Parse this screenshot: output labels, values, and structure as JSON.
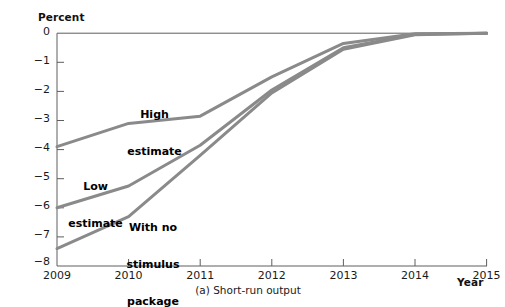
{
  "chart_data": {
    "type": "line",
    "title": "",
    "caption": "(a) Short-run output",
    "xlabel": "Year",
    "ylabel": "Percent",
    "x": [
      2009,
      2010,
      2011,
      2012,
      2013,
      2014,
      2015
    ],
    "xtick_labels": [
      "2009",
      "2010",
      "2011",
      "2012",
      "2013",
      "2014",
      "2015"
    ],
    "ytick_labels": [
      "0",
      "−1",
      "−2",
      "−3",
      "−4",
      "−5",
      "−6",
      "−7",
      "−8"
    ],
    "ytick_values": [
      0,
      -1,
      -2,
      -3,
      -4,
      -5,
      -6,
      -7,
      -8
    ],
    "xlim": [
      2009,
      2015
    ],
    "ylim": [
      -8,
      0
    ],
    "grid": false,
    "legend_position": "inline-annotations",
    "line_color": "#8a8a8a",
    "series": [
      {
        "name": "High estimate",
        "label": "High\nestimate",
        "values": [
          -3.9,
          -3.1,
          -2.85,
          -1.5,
          -0.35,
          -0.02,
          0.0
        ]
      },
      {
        "name": "Low estimate",
        "label": "Low\nestimate",
        "values": [
          -6.0,
          -5.25,
          -3.85,
          -1.95,
          -0.5,
          -0.04,
          0.0
        ]
      },
      {
        "name": "With no stimulus package",
        "label": "With no\nstimulus\npackage",
        "values": [
          -7.4,
          -6.3,
          -4.2,
          -2.05,
          -0.55,
          -0.05,
          0.0
        ]
      }
    ],
    "annotations": [
      {
        "name": "high-estimate-label",
        "lines": [
          "High",
          "estimate"
        ]
      },
      {
        "name": "low-estimate-label",
        "lines": [
          "Low",
          "estimate"
        ]
      },
      {
        "name": "no-stimulus-label",
        "lines": [
          "With no",
          "stimulus",
          "package"
        ]
      }
    ]
  },
  "labels": {
    "y_axis_title": "Percent",
    "x_axis_title": "Year",
    "caption": "(a) Short-run output",
    "y0": "0",
    "y1": "−1",
    "y2": "−2",
    "y3": "−3",
    "y4": "−4",
    "y5": "−5",
    "y6": "−6",
    "y7": "−7",
    "y8": "−8",
    "x2009": "2009",
    "x2010": "2010",
    "x2011": "2011",
    "x2012": "2012",
    "x2013": "2013",
    "x2014": "2014",
    "x2015": "2015",
    "annot_high_1": "High",
    "annot_high_2": "estimate",
    "annot_low_1": "Low",
    "annot_low_2": "estimate",
    "annot_nostim_1": "With no",
    "annot_nostim_2": "stimulus",
    "annot_nostim_3": "package"
  }
}
